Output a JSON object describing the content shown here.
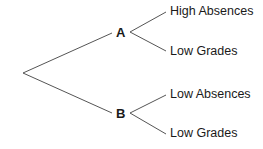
{
  "diagram": {
    "type": "tree",
    "line_color": "#555555",
    "root": {
      "children": [
        {
          "label": "A",
          "children": [
            {
              "label": "High Absences"
            },
            {
              "label": "Low Grades"
            }
          ]
        },
        {
          "label": "B",
          "children": [
            {
              "label": "Low Absences"
            },
            {
              "label": "Low Grades"
            }
          ]
        }
      ]
    }
  }
}
